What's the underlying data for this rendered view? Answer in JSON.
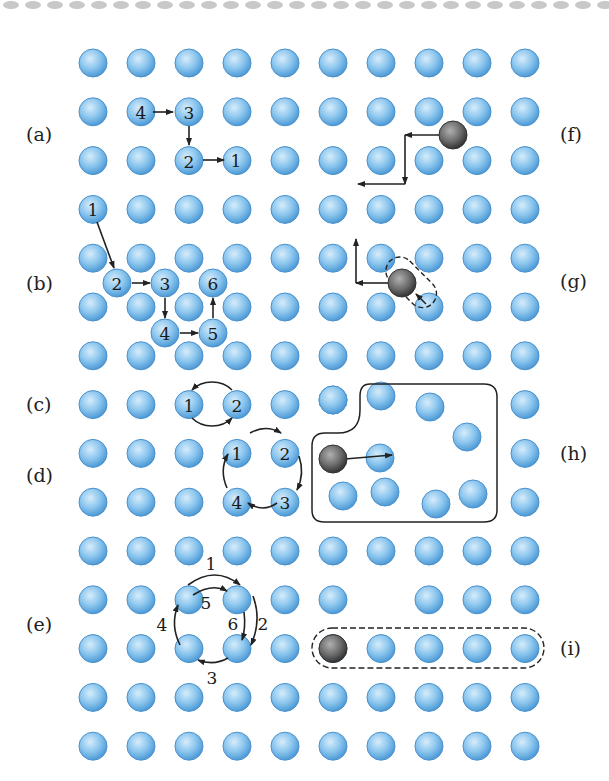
{
  "figure": {
    "lattice": {
      "columns": 10,
      "rows": 15,
      "atom_color": "#7fbde8",
      "atom_edge": "#4a90cc",
      "impurity_color": "#555555"
    },
    "panel_labels": {
      "a": "(a)",
      "b": "(b)",
      "c": "(c)",
      "d": "(d)",
      "e": "(e)",
      "f": "(f)",
      "g": "(g)",
      "h": "(h)",
      "i": "(i)"
    },
    "panel_a": {
      "atoms": [
        "4",
        "3",
        "2"
      ],
      "end_label": "1"
    },
    "panel_b": {
      "atoms": [
        "1",
        "2",
        "3",
        "4",
        "5",
        "6"
      ]
    },
    "panel_c": {
      "atoms": [
        "1",
        "2"
      ]
    },
    "panel_d": {
      "atoms": [
        "1",
        "2",
        "3",
        "4"
      ]
    },
    "panel_e": {
      "steps": [
        "1",
        "2",
        "3",
        "4",
        "5",
        "6"
      ]
    }
  }
}
